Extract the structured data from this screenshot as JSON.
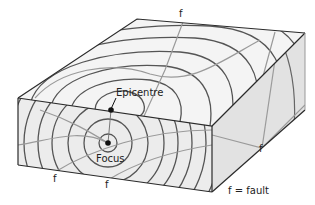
{
  "diagram": {
    "type": "block-diagram",
    "labels": {
      "epicentre": "Epicentre",
      "focus": "Focus",
      "fault_marks": [
        "f",
        "f",
        "f",
        "f"
      ],
      "legend": "f = fault"
    },
    "colors": {
      "outline": "#2a2a2a",
      "wavefront": "#555555",
      "fault_line": "#9a9a9a",
      "top_face": "#f4f4f4",
      "front_face": "#ececec",
      "side_face": "#e2e2e2",
      "background": "#ffffff"
    }
  }
}
